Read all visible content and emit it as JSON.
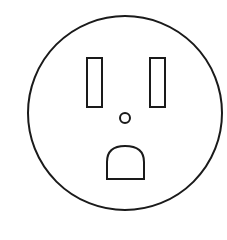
{
  "diagram": {
    "title": "Electrical outlet (NEMA 5-15 receptacle) front view",
    "stroke_color": "#1a1a1a",
    "background_color": "#ffffff",
    "parts": {
      "faceplate": {
        "label": "Outlet faceplate",
        "cx": 125,
        "cy": 113,
        "r": 97
      },
      "left_slot": {
        "label": "Neutral slot",
        "x": 87,
        "y": 58,
        "width": 15,
        "height": 49
      },
      "right_slot": {
        "label": "Hot slot",
        "x": 150,
        "y": 58,
        "width": 15,
        "height": 49
      },
      "center_screw": {
        "label": "Center screw hole",
        "cx": 125,
        "cy": 118,
        "r": 5
      },
      "ground_hole": {
        "label": "Ground hole",
        "x": 107,
        "y": 146,
        "width": 37,
        "height": 33
      }
    }
  }
}
